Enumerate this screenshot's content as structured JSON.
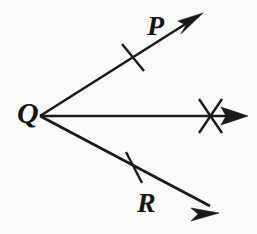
{
  "figure": {
    "background_color": "#fbfbfa",
    "stroke_color": "#1a1a1a",
    "width": 257,
    "height": 234,
    "labels": {
      "vertex": "Q",
      "upper_ray": "P",
      "lower_ray": "R"
    },
    "vertex_point": {
      "x": 40,
      "y": 116
    },
    "rays": [
      {
        "name": "ray-QP",
        "label": "P",
        "from": {
          "x": 40,
          "y": 116
        },
        "to": {
          "x": 199,
          "y": 16
        },
        "arrowhead_tip": {
          "x": 203,
          "y": 13
        },
        "tick_count": 1,
        "tick_center": {
          "x": 133,
          "y": 57
        }
      },
      {
        "name": "ray-Q-horizontal",
        "label": "",
        "from": {
          "x": 40,
          "y": 116
        },
        "to": {
          "x": 243,
          "y": 116
        },
        "arrowhead_tip": {
          "x": 248,
          "y": 116
        },
        "tick_count": 2,
        "tick_center": {
          "x": 210,
          "y": 116
        }
      },
      {
        "name": "ray-QR",
        "label": "R",
        "from": {
          "x": 40,
          "y": 116
        },
        "to": {
          "x": 214,
          "y": 209
        },
        "arrowhead_tip": {
          "x": 219,
          "y": 213
        },
        "tick_count": 1,
        "tick_center": {
          "x": 134,
          "y": 167
        }
      }
    ]
  }
}
